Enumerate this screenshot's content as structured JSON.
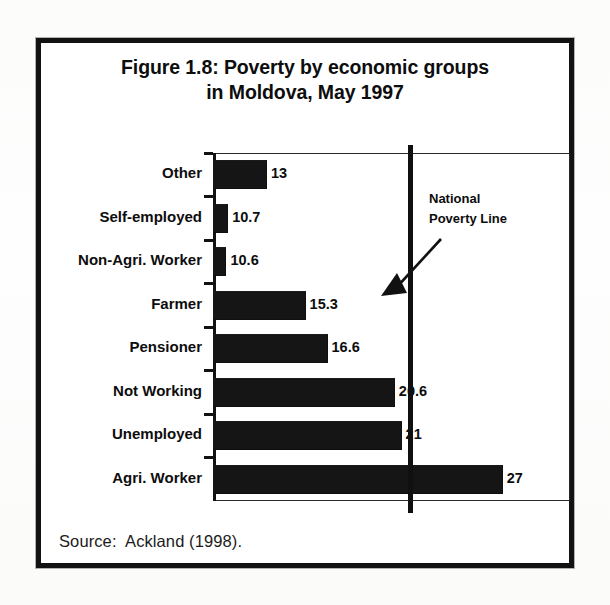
{
  "figure": {
    "title_line1": "Figure 1.8: Poverty by economic groups",
    "title_line2": "in Moldova, May 1997",
    "source": "Source:  Ackland (1998)."
  },
  "annotation": {
    "line1": "National",
    "line2": "Poverty Line",
    "arrow_icon": "arrow-down-left-icon"
  },
  "chart_data": {
    "type": "bar",
    "orientation": "horizontal",
    "title": "Figure 1.8: Poverty by economic groups in Moldova, May 1997",
    "xlabel": "",
    "ylabel": "",
    "grid": false,
    "legend": false,
    "xlim": [
      9.8,
      31.0
    ],
    "axis_note": "value axis is unlabeled and does not start at zero",
    "categories": [
      "Other",
      "Self-employed",
      "Non-Agri. Worker",
      "Farmer",
      "Pensioner",
      "Not Working",
      "Unemployed",
      "Agri. Worker"
    ],
    "values": [
      13,
      10.7,
      10.6,
      15.3,
      16.6,
      20.6,
      21,
      27
    ],
    "value_labels": [
      "13",
      "10.7",
      "10.6",
      "15.3",
      "16.6",
      "20.6",
      "21",
      "27"
    ],
    "reference_line": {
      "label": "National Poverty Line",
      "value": 21.5
    },
    "colors": {
      "bar": "#151515",
      "axis": "#121212",
      "text": "#0d0d0d",
      "reference_line": "#101010"
    }
  }
}
